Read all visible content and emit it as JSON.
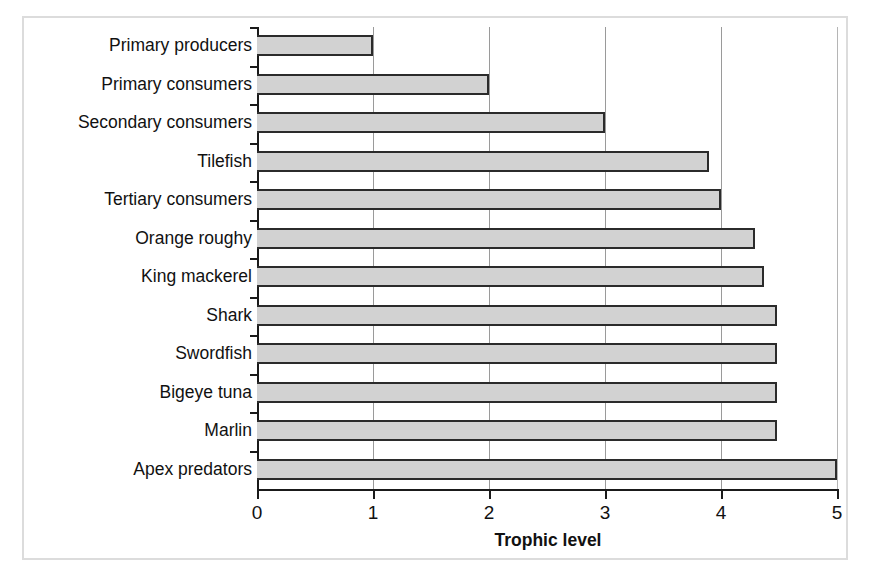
{
  "chart_data": {
    "type": "bar",
    "orientation": "horizontal",
    "title": "",
    "xlabel": "Trophic level",
    "ylabel": "",
    "xlim": [
      0,
      5
    ],
    "xticks": [
      "0",
      "1",
      "2",
      "3",
      "4",
      "5"
    ],
    "grid": "vertical",
    "legend": "none",
    "categories": [
      "Primary producers",
      "Primary consumers",
      "Secondary consumers",
      "Tilefish",
      "Tertiary consumers",
      "Orange roughy",
      "King mackerel",
      "Shark",
      "Swordfish",
      "Bigeye tuna",
      "Marlin",
      "Apex predators"
    ],
    "values": [
      1,
      2,
      3,
      3.9,
      4,
      4.29,
      4.37,
      4.48,
      4.48,
      4.48,
      4.48,
      5
    ],
    "bar_fill": "#d2d2d2",
    "bar_stroke": "#2b2b2b",
    "gridline_color": "#9a9a9a",
    "axis_color": "#1a1a1a",
    "frame_color": "#dcdcdc",
    "background": "#ffffff"
  }
}
